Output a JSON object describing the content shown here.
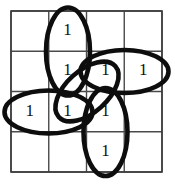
{
  "figure": {
    "type": "karnaugh-map",
    "background_color": "#ffffff",
    "grid_line_color": "#4a4a4a",
    "group_color": "#0d0d0d",
    "digit_color": "#111111"
  },
  "grid": {
    "rows": 4,
    "cols": 4,
    "left": 11,
    "top": 11,
    "right": 162,
    "bottom": 172,
    "cell_width": 37.75,
    "cell_height": 40.25,
    "x_lines": [
      11,
      48.75,
      86.5,
      124.25,
      162
    ],
    "y_lines": [
      11,
      51.25,
      91.5,
      131.75,
      172
    ]
  },
  "cells": [
    {
      "row": 0,
      "col": 0,
      "value": ""
    },
    {
      "row": 0,
      "col": 1,
      "value": "1"
    },
    {
      "row": 0,
      "col": 2,
      "value": ""
    },
    {
      "row": 0,
      "col": 3,
      "value": ""
    },
    {
      "row": 1,
      "col": 0,
      "value": ""
    },
    {
      "row": 1,
      "col": 1,
      "value": "1"
    },
    {
      "row": 1,
      "col": 2,
      "value": "1"
    },
    {
      "row": 1,
      "col": 3,
      "value": "1"
    },
    {
      "row": 2,
      "col": 0,
      "value": "1"
    },
    {
      "row": 2,
      "col": 1,
      "value": "1"
    },
    {
      "row": 2,
      "col": 2,
      "value": "1"
    },
    {
      "row": 2,
      "col": 3,
      "value": ""
    },
    {
      "row": 3,
      "col": 0,
      "value": ""
    },
    {
      "row": 3,
      "col": 1,
      "value": ""
    },
    {
      "row": 3,
      "col": 2,
      "value": "1"
    },
    {
      "row": 3,
      "col": 3,
      "value": ""
    }
  ],
  "digits": [
    {
      "label": "1",
      "cx": 67.6,
      "cy": 31.0
    },
    {
      "label": "1",
      "cx": 67.6,
      "cy": 71.5
    },
    {
      "label": "1",
      "cx": 105.4,
      "cy": 71.5
    },
    {
      "label": "1",
      "cx": 143.2,
      "cy": 71.5
    },
    {
      "label": "1",
      "cx": 29.8,
      "cy": 111.8
    },
    {
      "label": "1",
      "cx": 67.6,
      "cy": 111.8
    },
    {
      "label": "1",
      "cx": 105.4,
      "cy": 111.8
    },
    {
      "label": "1",
      "cx": 105.4,
      "cy": 152.0
    }
  ],
  "groups": [
    {
      "name": "vertical-group-top",
      "orientation": "vertical",
      "covers": "rows 0-1, column 1",
      "cx": 68.0,
      "cy": 51.5,
      "rx": 22.0,
      "ry": 44.0,
      "rotate": 0
    },
    {
      "name": "horizontal-group-right",
      "orientation": "horizontal",
      "covers": "row 1, columns 2-3",
      "cx": 124.5,
      "cy": 71.5,
      "rx": 44.0,
      "ry": 21.5,
      "rotate": 0
    },
    {
      "name": "horizontal-group-left",
      "orientation": "horizontal",
      "covers": "row 2, columns 0-1",
      "cx": 48.5,
      "cy": 112.0,
      "rx": 44.0,
      "ry": 21.5,
      "rotate": 0
    },
    {
      "name": "vertical-group-bottom",
      "orientation": "vertical",
      "covers": "rows 2-3, column 2",
      "cx": 105.5,
      "cy": 132.0,
      "rx": 22.0,
      "ry": 44.0,
      "rotate": 0
    },
    {
      "name": "diagonal-group-center",
      "orientation": "diagonal",
      "covers": "center cells row 1 col 2 and row 2 col 1",
      "cx": 87.0,
      "cy": 91.5,
      "rx": 38.0,
      "ry": 21.0,
      "rotate": -42
    }
  ]
}
